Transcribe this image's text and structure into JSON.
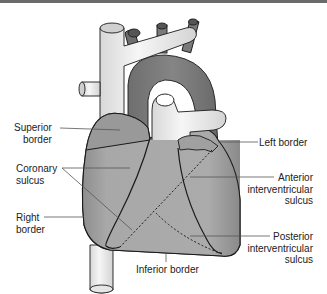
{
  "diagram": {
    "colors": {
      "heart_fill": "#a6a6a6",
      "vessel_fill": "#eeeeee",
      "aorta_fill": "#7d7d7d",
      "outline": "#1a1a1a",
      "leader_line": "#555555",
      "text": "#222222"
    },
    "labels": {
      "superior_border": "Superior border",
      "superior_border_l1": "Superior",
      "superior_border_l2": "border",
      "coronary_sulcus_l1": "Coronary",
      "coronary_sulcus_l2": "sulcus",
      "right_border_l1": "Right",
      "right_border_l2": "border",
      "left_border": "Left border",
      "anterior_iv_l1": "Anterior",
      "anterior_iv_l2": "interventricular",
      "anterior_iv_l3": "sulcus",
      "posterior_iv_l1": "Posterior",
      "posterior_iv_l2": "interventricular",
      "posterior_iv_l3": "sulcus",
      "inferior_border": "Inferior border"
    }
  }
}
